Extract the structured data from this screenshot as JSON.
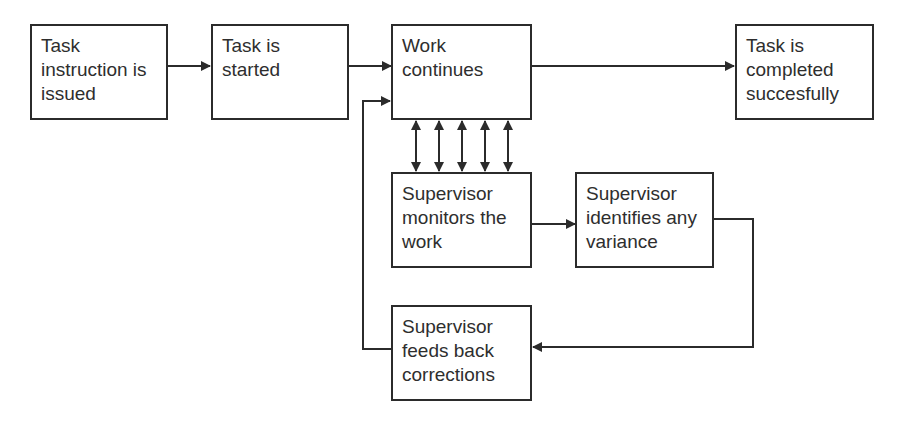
{
  "diagram": {
    "boxes": [
      {
        "id": "task-issued",
        "lines": [
          "Task",
          "instruction is",
          "issued"
        ]
      },
      {
        "id": "task-started",
        "lines": [
          "Task is",
          "started"
        ]
      },
      {
        "id": "work-continues",
        "lines": [
          "Work",
          "continues"
        ]
      },
      {
        "id": "task-completed",
        "lines": [
          "Task is",
          "completed",
          "succesfully"
        ]
      },
      {
        "id": "supervisor-monitors",
        "lines": [
          "Supervisor",
          "monitors the",
          "work"
        ]
      },
      {
        "id": "supervisor-identifies",
        "lines": [
          "Supervisor",
          "identifies any",
          "variance"
        ]
      },
      {
        "id": "supervisor-feeds-back",
        "lines": [
          "Supervisor",
          "feeds back",
          "corrections"
        ]
      }
    ],
    "edges": [
      {
        "from": "task-issued",
        "to": "task-started"
      },
      {
        "from": "task-started",
        "to": "work-continues"
      },
      {
        "from": "work-continues",
        "to": "task-completed"
      },
      {
        "from": "work-continues",
        "to": "supervisor-monitors",
        "bidirectional": true,
        "count": 5
      },
      {
        "from": "supervisor-monitors",
        "to": "supervisor-identifies"
      },
      {
        "from": "supervisor-identifies",
        "to": "supervisor-feeds-back"
      },
      {
        "from": "supervisor-feeds-back",
        "to": "work-continues"
      }
    ],
    "colors": {
      "stroke": "#2b2b2b",
      "text": "#2e2e2e",
      "background": "#ffffff"
    }
  }
}
